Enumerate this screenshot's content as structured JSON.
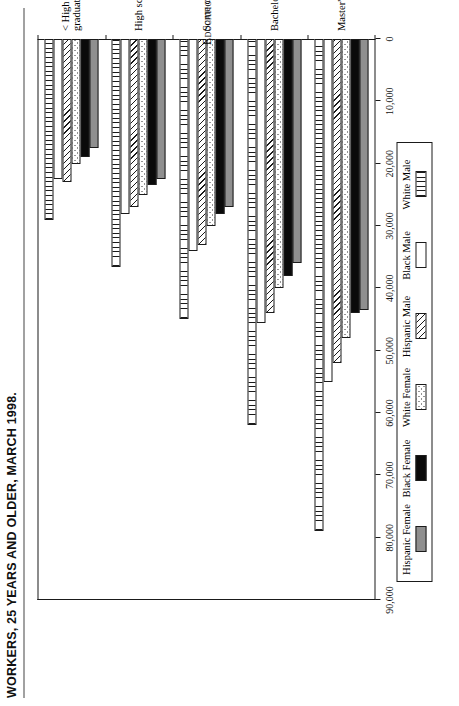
{
  "title": {
    "line1": "WORKERS, 25 YEARS AND OLDER, MARCH 1998."
  },
  "axes": {
    "value_axis_title": "Yearly Income",
    "category_axis_title": "Educational Attainment",
    "value_ticks": [
      "90,000",
      "80,000",
      "70,000",
      "60,000",
      "50,000",
      "40,000",
      "30,000",
      "20,000",
      "10,000",
      "0"
    ]
  },
  "legend": {
    "entries": [
      {
        "label": "Hispanic Female",
        "swatch": "solid-gray-swatch"
      },
      {
        "label": "Black Female",
        "swatch": "solid-black-swatch"
      },
      {
        "label": "White Female",
        "swatch": "dotted-swatch"
      },
      {
        "label": "Hispanic Male",
        "swatch": "diagonal-hatch-swatch"
      },
      {
        "label": "Black Male",
        "swatch": "empty-white-swatch"
      },
      {
        "label": "White Male",
        "swatch": "vertical-lines-swatch"
      }
    ]
  },
  "chart_data": {
    "type": "bar",
    "orientation": "horizontal",
    "title": "WORKERS, 25 YEARS AND OLDER, MARCH 1998.",
    "xlabel": "Educational Attainment",
    "ylabel": "Yearly Income",
    "ylim": [
      0,
      90000
    ],
    "grid": false,
    "legend_position": "below-plot",
    "categories": [
      "< High school graduate",
      "High school graduate",
      "Some college",
      "Bachelor's degree",
      "Master's degree"
    ],
    "series": [
      {
        "name": "Hispanic Female",
        "values": [
          17500,
          22500,
          27000,
          36000,
          43500
        ]
      },
      {
        "name": "Black Female",
        "values": [
          19000,
          23500,
          28000,
          38000,
          44000
        ]
      },
      {
        "name": "White Female",
        "values": [
          20000,
          25000,
          30000,
          40000,
          48000
        ]
      },
      {
        "name": "Hispanic Male",
        "values": [
          23000,
          27000,
          33000,
          44000,
          52000
        ]
      },
      {
        "name": "Black Male",
        "values": [
          22500,
          28000,
          34000,
          45500,
          55000
        ]
      },
      {
        "name": "White Male",
        "values": [
          29000,
          36500,
          45000,
          62000,
          79000
        ]
      }
    ]
  }
}
